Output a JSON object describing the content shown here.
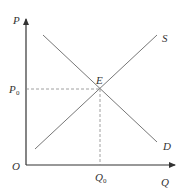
{
  "top_fragment": "(cut-off text from previous line)",
  "diagram": {
    "type": "supply-demand",
    "axes": {
      "y_label": "P",
      "x_label": "Q",
      "origin_label": "O"
    },
    "curves": [
      {
        "name": "S",
        "label": "S",
        "kind": "supply",
        "from": [
          35,
          149
        ],
        "to": [
          157,
          35
        ]
      },
      {
        "name": "D",
        "label": "D",
        "kind": "demand",
        "from": [
          43,
          35
        ],
        "to": [
          157,
          142
        ]
      }
    ],
    "equilibrium": {
      "label": "E",
      "price_label": "P",
      "price_sub": "0",
      "quantity_label": "Q",
      "quantity_sub": "0"
    },
    "colors": {
      "axis": "#333333",
      "curve": "#777777",
      "guide": "#888888",
      "text": "#333333"
    }
  }
}
